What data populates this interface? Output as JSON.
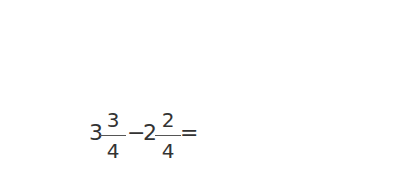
{
  "number_line": {
    "min": 0,
    "max": 4,
    "minor_step": 0.25,
    "labels": [
      "0",
      "1",
      "2",
      "3",
      "4"
    ],
    "segment": {
      "from": 1.25,
      "to": 3.75
    },
    "upper_arc": {
      "from": 0,
      "to": 3.75,
      "label_whole": "3",
      "label_num": "3",
      "label_den": "4"
    },
    "lower_arc": {
      "from": 1.25,
      "to": 3.75,
      "label_whole": "2",
      "label_num": "2",
      "label_den": "4"
    }
  },
  "equation": {
    "term1": {
      "whole": "3",
      "num": "3",
      "den": "4"
    },
    "minus1": "−",
    "term2": {
      "whole": "2",
      "num": "2",
      "den": "4"
    },
    "eq1": "=",
    "term3": {
      "num": "15",
      "den": "4"
    },
    "minus2": "−",
    "term4": {
      "num": "",
      "den": "4"
    },
    "eq2": "=",
    "term5": {
      "num": "",
      "den": "4"
    },
    "eq3": "=",
    "term6": {
      "whole": "",
      "num": "",
      "den": "4"
    }
  },
  "colors": {
    "given_fraction": "#3a7fc1",
    "line": "#222222",
    "segment": "#555555"
  }
}
